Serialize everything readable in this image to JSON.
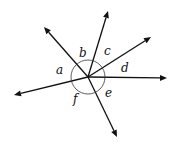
{
  "diagram": {
    "angle_labels": [
      "a",
      "b",
      "c",
      "d",
      "e",
      "f"
    ],
    "rays": [
      {
        "id": "up",
        "name": "ray-up"
      },
      {
        "id": "upper-left",
        "name": "ray-upper-left"
      },
      {
        "id": "upper-right",
        "name": "ray-upper-right"
      },
      {
        "id": "right",
        "name": "ray-right"
      },
      {
        "id": "lower-left",
        "name": "ray-lower-left"
      },
      {
        "id": "down",
        "name": "ray-down"
      }
    ],
    "colors": {
      "line": "#111111",
      "background": "#ffffff"
    }
  }
}
